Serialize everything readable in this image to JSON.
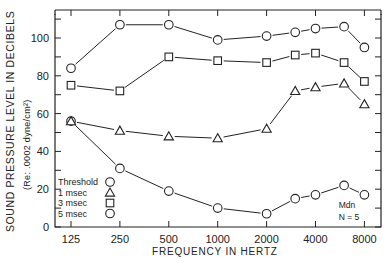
{
  "chart_data": {
    "type": "line",
    "title": "",
    "xlabel": "FREQUENCY IN HERTZ",
    "ylabel": "SOUND PRESSURE LEVEL IN DECIBELS",
    "ylabel_sub": "(Re: .0002 dyne/cm²)",
    "x_scale": "log2",
    "x_tick_labels": [
      "125",
      "250",
      "500",
      "1000",
      "2000",
      "4000",
      "8000"
    ],
    "x_ticks": [
      125,
      250,
      500,
      1000,
      2000,
      4000,
      8000
    ],
    "y_tick_labels": [
      "0",
      "20",
      "40",
      "60",
      "80",
      "100"
    ],
    "y_ticks": [
      0,
      20,
      40,
      60,
      80,
      100
    ],
    "ylim": [
      0,
      115
    ],
    "grid": false,
    "legend_position": "lower-left inside",
    "x": [
      125,
      250,
      500,
      1000,
      2000,
      3000,
      4000,
      6000,
      8000
    ],
    "series": [
      {
        "name": "Threshold",
        "marker": "circle",
        "values": [
          56,
          31,
          19,
          10,
          7,
          15,
          17,
          22,
          17
        ]
      },
      {
        "name": "1 msec",
        "marker": "triangle",
        "values": [
          56,
          51,
          48,
          47,
          52,
          72,
          74,
          76,
          65
        ]
      },
      {
        "name": "3 msec",
        "marker": "square",
        "values": [
          75,
          72,
          90,
          88,
          87,
          91,
          92,
          87,
          77
        ]
      },
      {
        "name": "5 msec",
        "marker": "circle",
        "values": [
          84,
          107,
          107,
          99,
          101,
          103,
          105,
          106,
          95
        ]
      }
    ],
    "annotations": [
      "Mdn",
      "N = 5"
    ]
  },
  "legend": {
    "items": [
      {
        "label": "Threshold",
        "marker": "circle"
      },
      {
        "label": "1 msec",
        "marker": "triangle"
      },
      {
        "label": "3 msec",
        "marker": "square"
      },
      {
        "label": "5 msec",
        "marker": "circle"
      }
    ]
  },
  "labels": {
    "ylabel": "SOUND PRESSURE LEVEL IN DECIBELS",
    "ylabel_sub": "(Re: .0002 dyne/cm²)",
    "xlabel": "FREQUENCY IN HERTZ",
    "note_line1": "Mdn",
    "note_line2": "N = 5"
  },
  "colors": {
    "ink": "#222222",
    "background": "#ffffff"
  }
}
